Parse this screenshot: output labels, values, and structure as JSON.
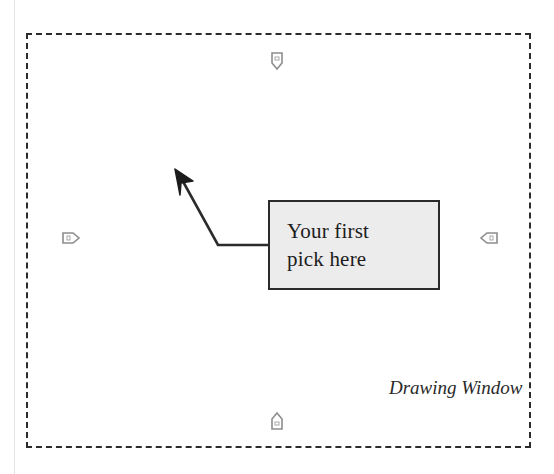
{
  "figure": {
    "background_color": "#ffffff",
    "line_color": "#2b2b2b",
    "box_fill_color": "#ececec"
  },
  "drawing_window": {
    "label": "Drawing Window",
    "border_style": "dashed"
  },
  "callout": {
    "line1": "Your first",
    "line2": "pick here",
    "leader": {
      "arrow_tip_x": 176,
      "arrow_tip_y": 170,
      "bend_x": 218,
      "bend_y": 245,
      "anchor_x": 268,
      "anchor_y": 245
    }
  },
  "grips": [
    {
      "name": "grip-top",
      "direction": "down"
    },
    {
      "name": "grip-bottom",
      "direction": "up"
    },
    {
      "name": "grip-left",
      "direction": "right"
    },
    {
      "name": "grip-right",
      "direction": "left"
    }
  ]
}
